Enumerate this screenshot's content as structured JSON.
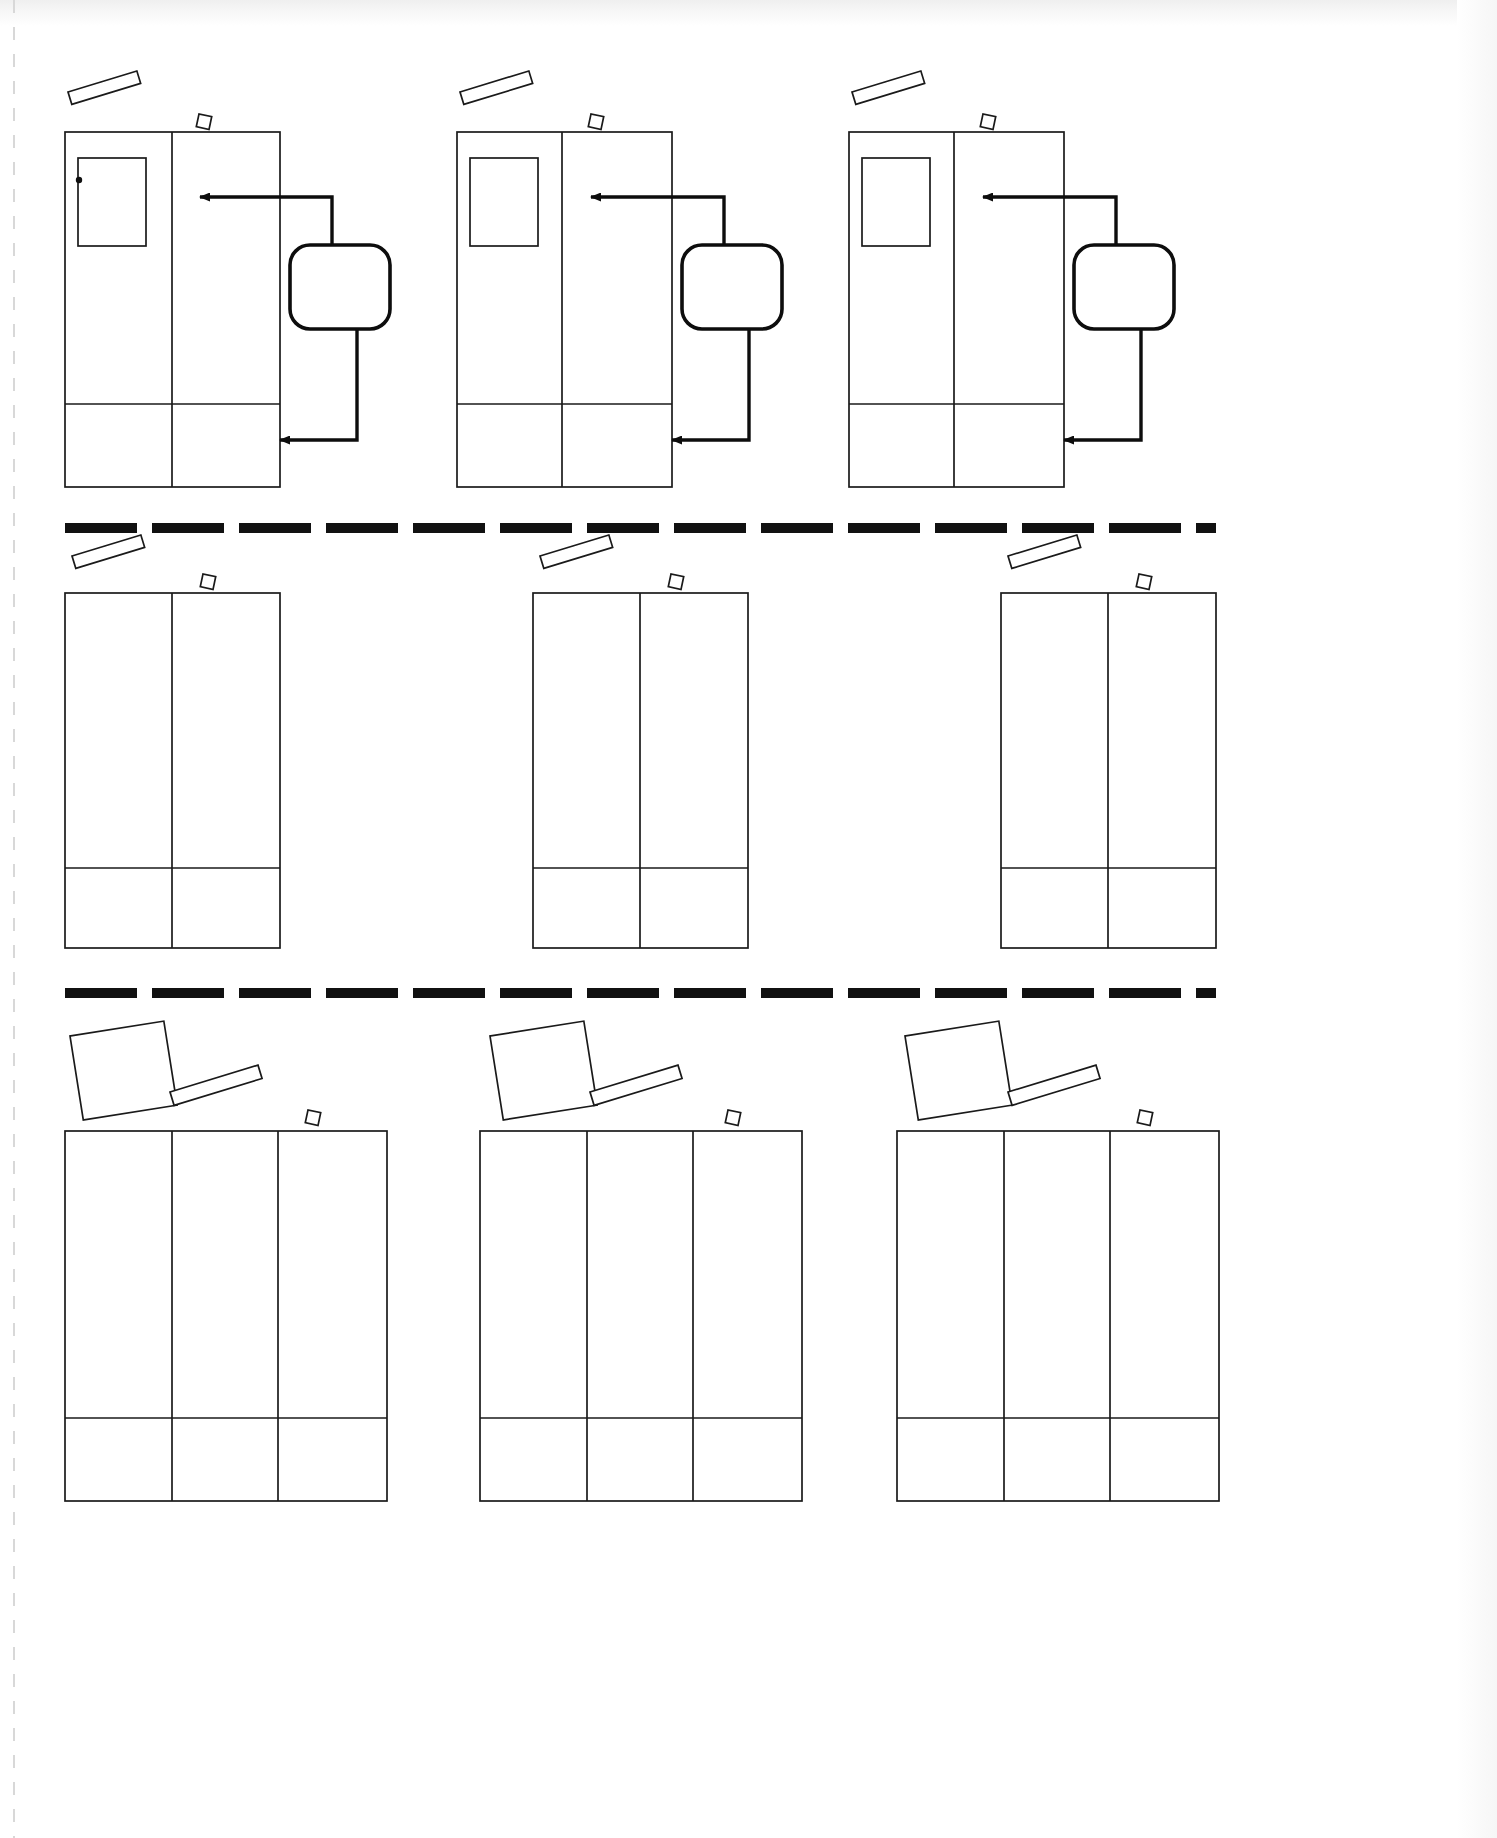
{
  "page": {
    "background_color": "#ffffff",
    "ink_color": "#1a1a1a",
    "accent_color": "#0d0d0d",
    "width": 1497,
    "height": 1838,
    "row_count": 3,
    "panels_per_row": 3
  },
  "edges": {
    "perforation_label": "left-perforation-strip",
    "scan_shadow_label": "scan-edge-shadow"
  },
  "separators": [
    {
      "name": "separator-row-1",
      "y": 528,
      "dash_count": 14,
      "dash_color": "#111111",
      "thickness": 10
    },
    {
      "name": "separator-row-2",
      "y": 993,
      "dash_count": 14,
      "dash_color": "#111111",
      "thickness": 10
    }
  ],
  "rows": [
    {
      "id": "row-1",
      "label": "Row 1 — annotated frames",
      "frame_columns": 2,
      "has_inner_box": true,
      "has_annotations": true,
      "panels": [
        {
          "id": "row1-panel-1",
          "x": 65,
          "y": 132,
          "w": 215,
          "h": 355,
          "divider_x": 172,
          "footer_y": 404,
          "inner_box": {
            "x": 78,
            "y": 158,
            "w": 68,
            "h": 88
          },
          "handle_dot": {
            "x": 79,
            "y": 180
          },
          "pen": {
            "x": 68,
            "y": 92,
            "w": 72,
            "h": 13,
            "rotate": -17
          },
          "chip": {
            "x": 199,
            "y": 114,
            "w": 13,
            "h": 13,
            "rotate": 12
          },
          "callout": {
            "x": 290,
            "y": 245,
            "w": 100,
            "h": 84,
            "radius": 20
          },
          "arrow_top": {
            "from_x": 332,
            "from_y": 245,
            "to_x": 196,
            "to_y": 197
          },
          "arrow_bottom": {
            "from_x": 357,
            "from_y": 329,
            "to_x": 276,
            "to_y": 440
          }
        },
        {
          "id": "row1-panel-2",
          "x": 457,
          "y": 132,
          "w": 215,
          "h": 355,
          "divider_x": 562,
          "footer_y": 404,
          "inner_box": {
            "x": 470,
            "y": 158,
            "w": 68,
            "h": 88
          },
          "handle_dot": null,
          "pen": {
            "x": 460,
            "y": 92,
            "w": 72,
            "h": 13,
            "rotate": -17
          },
          "chip": {
            "x": 591,
            "y": 114,
            "w": 13,
            "h": 13,
            "rotate": 12
          },
          "callout": {
            "x": 682,
            "y": 245,
            "w": 100,
            "h": 84,
            "radius": 20
          },
          "arrow_top": {
            "from_x": 724,
            "from_y": 245,
            "to_x": 587,
            "to_y": 197
          },
          "arrow_bottom": {
            "from_x": 749,
            "from_y": 329,
            "to_x": 668,
            "to_y": 440
          }
        },
        {
          "id": "row1-panel-3",
          "x": 849,
          "y": 132,
          "w": 215,
          "h": 355,
          "divider_x": 954,
          "footer_y": 404,
          "inner_box": {
            "x": 862,
            "y": 158,
            "w": 68,
            "h": 88
          },
          "handle_dot": null,
          "pen": {
            "x": 852,
            "y": 92,
            "w": 72,
            "h": 13,
            "rotate": -17
          },
          "chip": {
            "x": 983,
            "y": 114,
            "w": 13,
            "h": 13,
            "rotate": 12
          },
          "callout": {
            "x": 1074,
            "y": 245,
            "w": 100,
            "h": 84,
            "radius": 20
          },
          "arrow_top": {
            "from_x": 1116,
            "from_y": 245,
            "to_x": 979,
            "to_y": 197
          },
          "arrow_bottom": {
            "from_x": 1141,
            "from_y": 329,
            "to_x": 1060,
            "to_y": 440
          }
        }
      ]
    },
    {
      "id": "row-2",
      "label": "Row 2 — plain two-column frames",
      "frame_columns": 2,
      "has_inner_box": false,
      "has_annotations": false,
      "panels": [
        {
          "id": "row2-panel-1",
          "x": 65,
          "y": 593,
          "w": 215,
          "h": 355,
          "divider_x": 172,
          "footer_y": 868,
          "pen": {
            "x": 72,
            "y": 556,
            "w": 72,
            "h": 13,
            "rotate": -17
          },
          "chip": {
            "x": 203,
            "y": 574,
            "w": 13,
            "h": 13,
            "rotate": 12
          }
        },
        {
          "id": "row2-panel-2",
          "x": 533,
          "y": 593,
          "w": 215,
          "h": 355,
          "divider_x": 640,
          "footer_y": 868,
          "pen": {
            "x": 540,
            "y": 556,
            "w": 72,
            "h": 13,
            "rotate": -17
          },
          "chip": {
            "x": 671,
            "y": 574,
            "w": 13,
            "h": 13,
            "rotate": 12
          }
        },
        {
          "id": "row2-panel-3",
          "x": 1001,
          "y": 593,
          "w": 215,
          "h": 355,
          "divider_x": 1108,
          "footer_y": 868,
          "pen": {
            "x": 1008,
            "y": 556,
            "w": 72,
            "h": 13,
            "rotate": -17
          },
          "chip": {
            "x": 1139,
            "y": 574,
            "w": 13,
            "h": 13,
            "rotate": 12
          }
        }
      ]
    },
    {
      "id": "row-3",
      "label": "Row 3 — three-column frames with tilted card",
      "frame_columns": 3,
      "has_inner_box": false,
      "has_annotations": false,
      "panels": [
        {
          "id": "row3-panel-1",
          "x": 65,
          "y": 1131,
          "w": 322,
          "h": 370,
          "divider_x_1": 172,
          "divider_x_2": 278,
          "footer_y": 1418,
          "card": {
            "x": 70,
            "y": 1036,
            "w": 95,
            "h": 85,
            "rotate": -9
          },
          "pen": {
            "x": 170,
            "y": 1092,
            "w": 92,
            "h": 14,
            "rotate": -17
          },
          "chip": {
            "x": 308,
            "y": 1110,
            "w": 13,
            "h": 13,
            "rotate": 12
          }
        },
        {
          "id": "row3-panel-2",
          "x": 480,
          "y": 1131,
          "w": 322,
          "h": 370,
          "divider_x_1": 587,
          "divider_x_2": 693,
          "footer_y": 1418,
          "card": {
            "x": 490,
            "y": 1036,
            "w": 95,
            "h": 85,
            "rotate": -9
          },
          "pen": {
            "x": 590,
            "y": 1092,
            "w": 92,
            "h": 14,
            "rotate": -17
          },
          "chip": {
            "x": 728,
            "y": 1110,
            "w": 13,
            "h": 13,
            "rotate": 12
          }
        },
        {
          "id": "row3-panel-3",
          "x": 897,
          "y": 1131,
          "w": 322,
          "h": 370,
          "divider_x_1": 1004,
          "divider_x_2": 1110,
          "footer_y": 1418,
          "card": {
            "x": 905,
            "y": 1036,
            "w": 95,
            "h": 85,
            "rotate": -9
          },
          "pen": {
            "x": 1008,
            "y": 1092,
            "w": 92,
            "h": 14,
            "rotate": -17
          },
          "chip": {
            "x": 1140,
            "y": 1110,
            "w": 13,
            "h": 13,
            "rotate": 12
          }
        }
      ]
    }
  ],
  "icon_names": {
    "pen": "pen-icon",
    "chip": "chip-square-icon",
    "card": "tilted-card-icon",
    "callout": "rounded-callout-shape",
    "arrow": "arrow-pointer-icon",
    "dot": "anchor-dot-icon"
  }
}
